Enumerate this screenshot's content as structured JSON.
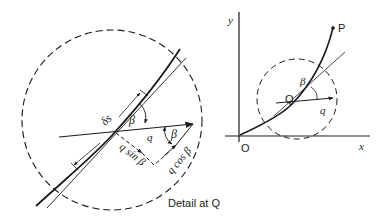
{
  "detail_diagram": {
    "caption": "Detail at Q",
    "labels": {
      "ds": "δs",
      "beta_top": "β",
      "beta_right": "β",
      "q": "q",
      "q_sin": "q sin β",
      "q_cos": "q cos β"
    }
  },
  "overview_diagram": {
    "axis_y": "y",
    "axis_x": "x",
    "origin": "O",
    "point_P": "P",
    "point_Q": "Q",
    "beta": "β",
    "q": "q"
  },
  "colors": {
    "ink": "#1a1a1a",
    "background": "#ffffff"
  }
}
